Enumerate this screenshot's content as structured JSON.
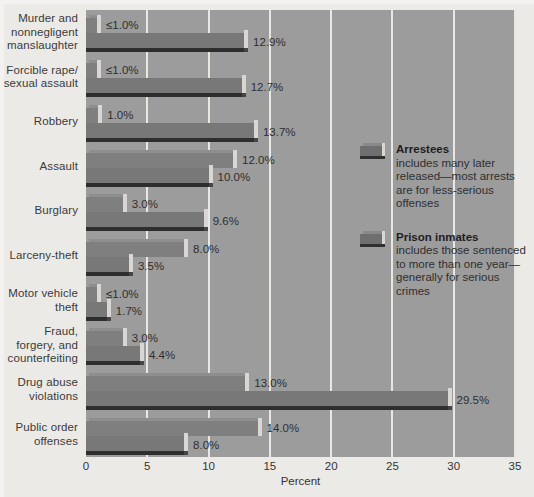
{
  "chart_data": {
    "type": "bar",
    "orientation": "horizontal",
    "title": "",
    "xlabel": "Percent",
    "ylabel": "",
    "xlim": [
      0,
      35
    ],
    "xticks": [
      "0",
      "5",
      "10",
      "15",
      "20",
      "25",
      "30",
      "35"
    ],
    "grid": true,
    "legend_position": "inside-right",
    "categories": [
      "Murder and nonnegligent manslaughter",
      "Forcible rape/ sexual assault",
      "Robbery",
      "Assault",
      "Burglary",
      "Larceny-theft",
      "Motor vehicle theft",
      "Fraud, forgery, and counterfeiting",
      "Drug abuse violations",
      "Public order offenses"
    ],
    "series": [
      {
        "name": "Arrestees",
        "values": [
          0.9,
          0.9,
          1.0,
          12.0,
          3.0,
          8.0,
          0.9,
          3.0,
          13.0,
          14.0
        ],
        "labels": [
          "≤1.0%",
          "≤1.0%",
          "1.0%",
          "12.0%",
          "3.0%",
          "8.0%",
          "≤1.0%",
          "3.0%",
          "13.0%",
          "14.0%"
        ]
      },
      {
        "name": "Prison inmates",
        "values": [
          12.9,
          12.7,
          13.7,
          10.0,
          9.6,
          3.5,
          1.7,
          4.4,
          29.5,
          8.0
        ],
        "labels": [
          "12.9%",
          "12.7%",
          "13.7%",
          "10.0%",
          "9.6%",
          "3.5%",
          "1.7%",
          "4.4%",
          "29.5%",
          "8.0%"
        ]
      }
    ],
    "colors": {
      "plot_background": "#9c9c9c",
      "figure_background": "#eceae7",
      "bar_arrestees": "#7f7f7f",
      "bar_inmates": "#787878",
      "gridline": "#e8e7e4",
      "text": "#2f2f2f"
    }
  },
  "categories_display": [
    {
      "lines": [
        "Murder and",
        "nonnegligent",
        "manslaughter"
      ]
    },
    {
      "lines": [
        "Forcible rape/",
        "sexual assault"
      ]
    },
    {
      "lines": [
        "Robbery"
      ]
    },
    {
      "lines": [
        "Assault"
      ]
    },
    {
      "lines": [
        "Burglary"
      ]
    },
    {
      "lines": [
        "Larceny-theft"
      ]
    },
    {
      "lines": [
        "Motor vehicle",
        "theft"
      ]
    },
    {
      "lines": [
        "Fraud,",
        "forgery, and",
        "counterfeiting"
      ]
    },
    {
      "lines": [
        "Drug abuse",
        "violations"
      ]
    },
    {
      "lines": [
        "Public order",
        "offenses"
      ]
    }
  ],
  "axis": {
    "x_label": "Percent",
    "ticks": [
      "0",
      "5",
      "10",
      "15",
      "20",
      "25",
      "30",
      "35"
    ]
  },
  "legend": {
    "entries": [
      {
        "title": "Arrestees",
        "description": "includes many later released—most arrests are for less-serious offenses",
        "swatch_name": "legend-swatch-arrestees"
      },
      {
        "title": "Prison inmates",
        "description": "includes those sentenced to more than one year—generally for serious crimes",
        "swatch_name": "legend-swatch-prison-inmates"
      }
    ]
  }
}
